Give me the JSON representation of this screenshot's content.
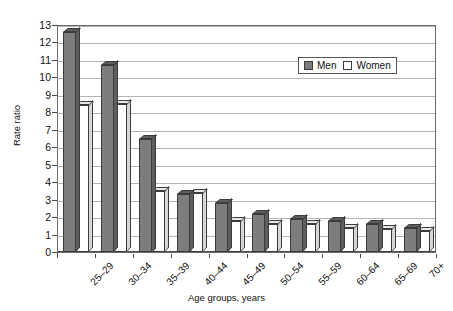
{
  "chart_data": {
    "type": "bar",
    "title": "",
    "xlabel": "Age groups, years",
    "ylabel": "Rate ratio",
    "ylim": [
      0,
      13
    ],
    "ytick_step": 1,
    "grid": true,
    "legend_position": "top-right",
    "categories": [
      "25–29",
      "30–34",
      "35–39",
      "40–44",
      "45–49",
      "50–54",
      "55–59",
      "60–64",
      "65–69",
      "70+"
    ],
    "yticks": [
      "0",
      "1",
      "2",
      "3",
      "4",
      "5",
      "6",
      "7",
      "8",
      "9",
      "10",
      "11",
      "12",
      "13"
    ],
    "series": [
      {
        "name": "Men",
        "color": "#7d7d7d",
        "values": [
          12.6,
          10.7,
          6.5,
          3.3,
          2.8,
          2.2,
          1.9,
          1.8,
          1.6,
          1.4
        ]
      },
      {
        "name": "Women",
        "color": "#ffffff",
        "values": [
          8.4,
          8.5,
          3.5,
          3.4,
          1.8,
          1.6,
          1.6,
          1.4,
          1.3,
          1.2
        ]
      }
    ]
  },
  "legend": {
    "items": [
      {
        "label": "Men",
        "swatch": "#7d7d7d"
      },
      {
        "label": "Women",
        "swatch": "#ffffff"
      }
    ]
  },
  "axes": {
    "y_title": "Rate ratio",
    "x_title": "Age groups, years"
  }
}
